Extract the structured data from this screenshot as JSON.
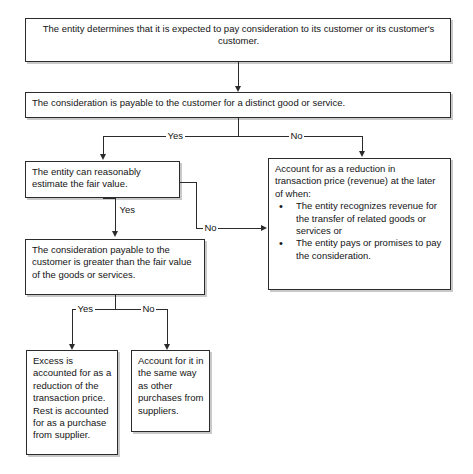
{
  "diagram": {
    "line_color": "#2b2b2b",
    "box_border_color": "#2b2b2b",
    "background": "#ffffff",
    "nodes": {
      "start": {
        "id": "start",
        "text": "The entity determines that it is expected to pay consideration to its customer or its customer's customer."
      },
      "distinct_good": {
        "id": "distinct-good",
        "text": "The consideration is payable to the customer for a distinct good or service."
      },
      "fair_value": {
        "id": "fair-value",
        "text": "The entity can reasonably estimate the fair value."
      },
      "reduction": {
        "id": "reduction",
        "intro_line_1": "Account for as a reduction in",
        "intro_line_2": "transaction price (revenue) at the later",
        "intro_line_3": "of when:",
        "bullets": [
          "The entity recognizes revenue for the transfer of related goods or services or",
          "The entity pays or promises to pay the consideration."
        ]
      },
      "greater_than": {
        "id": "greater-than",
        "text": "The consideration payable to the customer is greater than the fair value of the goods or services."
      },
      "excess": {
        "id": "excess",
        "text": "Excess is accounted for as a reduction of the transaction price. Rest is accounted for as a purchase from supplier."
      },
      "same_way": {
        "id": "same-way",
        "text": "Account for it in the same way as other purchases from suppliers."
      }
    },
    "edge_labels": {
      "distinct_yes": "Yes",
      "distinct_no": "No",
      "fair_value_yes": "Yes",
      "fair_value_no": "No",
      "greater_yes": "Yes",
      "greater_no": "No"
    }
  }
}
